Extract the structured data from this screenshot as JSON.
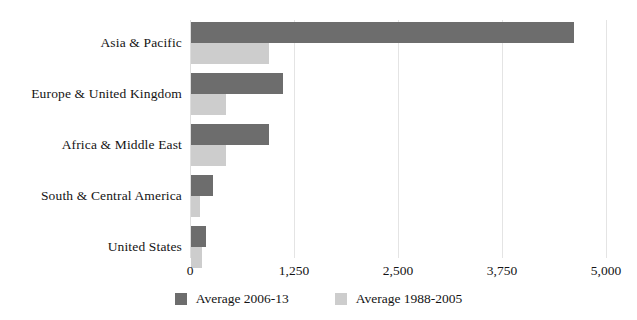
{
  "chart_data": {
    "type": "bar",
    "orientation": "horizontal",
    "title": "",
    "xlabel": "",
    "ylabel": "",
    "categories": [
      "Asia & Pacific",
      "Europe & United Kingdom",
      "Africa & Middle East",
      "South & Central America",
      "United States"
    ],
    "series": [
      {
        "name": "Average 2006-13",
        "color": "#6d6d6d",
        "values": [
          4600,
          1105,
          937,
          264,
          180
        ]
      },
      {
        "name": "Average 1988-2005",
        "color": "#cdcdcd",
        "values": [
          937,
          420,
          420,
          108,
          132
        ]
      }
    ],
    "xlim": [
      0,
      5000
    ],
    "xticks": [
      0,
      1250,
      2500,
      3750,
      5000
    ],
    "xtick_labels": [
      "0",
      "1,250",
      "2,500",
      "3,750",
      "5,000"
    ],
    "grid": "vertical",
    "legend_position": "bottom-center"
  },
  "legend": {
    "items": [
      {
        "label": "Average 2006-13",
        "color": "#6d6d6d"
      },
      {
        "label": "Average 1988-2005",
        "color": "#cdcdcd"
      }
    ]
  },
  "colors": {
    "series_dark": "#6d6d6d",
    "series_light": "#cdcdcd",
    "gridline": "#e4e4e4",
    "text": "#141414",
    "background": "#ffffff"
  }
}
